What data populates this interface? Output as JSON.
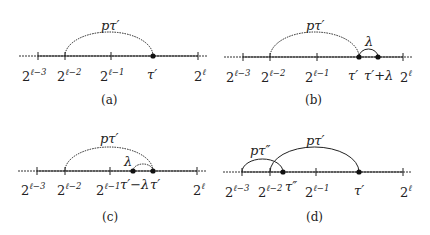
{
  "figure": {
    "panels": [
      {
        "id": "a",
        "caption": "(a)",
        "ticks": [
          "2",
          "2",
          "2",
          "2"
        ],
        "tick_exponents": [
          "ℓ−3",
          "ℓ−2",
          "ℓ−1",
          "ℓ"
        ],
        "points": [
          {
            "label": "τ′"
          }
        ],
        "arcs": [
          {
            "label": "pτ′",
            "from": "2^{ℓ−2}",
            "to": "τ′"
          }
        ]
      },
      {
        "id": "b",
        "caption": "(b)",
        "ticks": [
          "2",
          "2",
          "2",
          "2"
        ],
        "tick_exponents": [
          "ℓ−3",
          "ℓ−2",
          "ℓ−1",
          "ℓ"
        ],
        "points": [
          {
            "label": "τ′"
          },
          {
            "label": "τ′+λ"
          }
        ],
        "arcs": [
          {
            "label": "pτ′",
            "from": "2^{ℓ−2}",
            "to": "τ′"
          },
          {
            "label": "λ",
            "from": "τ′",
            "to": "τ′+λ"
          }
        ]
      },
      {
        "id": "c",
        "caption": "(c)",
        "ticks": [
          "2",
          "2",
          "2",
          "2"
        ],
        "tick_exponents": [
          "ℓ−3",
          "ℓ−2",
          "ℓ−1",
          "ℓ"
        ],
        "points": [
          {
            "label": "τ′−λ"
          },
          {
            "label": "τ′"
          }
        ],
        "arcs": [
          {
            "label": "pτ′",
            "from": "2^{ℓ−2}",
            "to": "τ′"
          },
          {
            "label": "λ",
            "from": "τ′−λ",
            "to": "τ′"
          }
        ]
      },
      {
        "id": "d",
        "caption": "(d)",
        "ticks": [
          "2",
          "2",
          "2",
          "2"
        ],
        "tick_exponents": [
          "ℓ−3",
          "ℓ−2",
          "ℓ−1",
          "ℓ"
        ],
        "points": [
          {
            "label": "τ″"
          },
          {
            "label": "τ′"
          }
        ],
        "arcs": [
          {
            "label": "pτ″",
            "from": "2^{ℓ−3}",
            "to": "τ″"
          },
          {
            "label": "pτ′",
            "from": "2^{ℓ−2}",
            "to": "τ′"
          }
        ]
      }
    ]
  }
}
